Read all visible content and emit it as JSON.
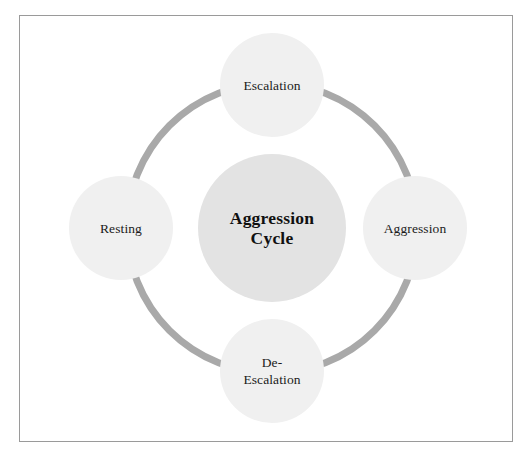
{
  "diagram": {
    "title": "Aggression Cycle",
    "type": "cycle-diagram",
    "center": {
      "label": "Aggression\nCycle",
      "fill_color": "#e3e3e3"
    },
    "ring": {
      "color": "#a9a9a9",
      "thickness_px": 7,
      "style": "solid-circle"
    },
    "frame": {
      "border_color": "#9a9a9a",
      "background_color": "#ffffff"
    },
    "node_fill_color": "#f0f0f0",
    "node_text_color": "#1b1b1b",
    "nodes": [
      {
        "id": "escalation",
        "label": "Escalation",
        "position": "top",
        "order": 1
      },
      {
        "id": "aggression",
        "label": "Aggression",
        "position": "right",
        "order": 2
      },
      {
        "id": "de-escalation",
        "label": "De-\nEscalation",
        "position": "bottom",
        "order": 3
      },
      {
        "id": "resting",
        "label": "Resting",
        "position": "left",
        "order": 4
      }
    ]
  }
}
